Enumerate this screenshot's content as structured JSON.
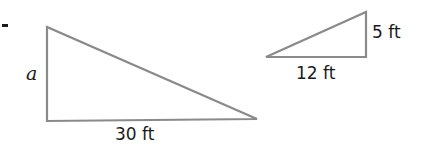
{
  "diagram": {
    "type": "similar-right-triangles",
    "large_triangle": {
      "vertical_side_label": "a",
      "base_label": "30 ft"
    },
    "small_triangle": {
      "vertical_side_label": "5 ft",
      "base_label": "12 ft"
    },
    "colors": {
      "stroke": "#8a8a8a",
      "text": "#1a1a1a",
      "background": "#ffffff"
    }
  }
}
